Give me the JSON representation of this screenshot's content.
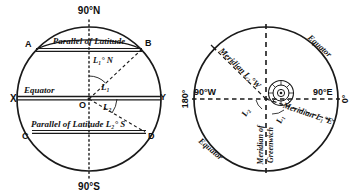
{
  "figure": {
    "background_color": "#ffffff",
    "line_color": "#1a1a1a"
  },
  "left_diagram": {
    "name": "parallels-of-latitude-sphere",
    "poles": {
      "north": "90°N",
      "south": "90°S"
    },
    "axis_points": {
      "left": "X",
      "right": "Y",
      "center": "O"
    },
    "corner_points": {
      "upper_left": "A",
      "upper_right": "B",
      "lower_left": "C",
      "lower_right": "D"
    },
    "lines": [
      {
        "label": "Equator",
        "kind": "equator"
      },
      {
        "label": "Parallel of Latitude",
        "sub": "L",
        "subscript": "1",
        "degree": "°",
        "hemisphere": "N",
        "kind": "parallel-north"
      },
      {
        "label": "Parallel of Latitude",
        "sub": "L",
        "subscript": "2",
        "degree": "°",
        "hemisphere": "S",
        "kind": "parallel-south"
      }
    ],
    "angles": [
      {
        "label": "L",
        "subscript": "1",
        "meaning": "latitude-angle-north"
      },
      {
        "label": "L",
        "subscript": "2",
        "meaning": "latitude-angle-south"
      }
    ],
    "text": {
      "equator": "Equator",
      "parallel_of_latitude": "Parallel of Latitude",
      "lat1_tag": "L₁° N",
      "lat2_full": "Parallel of Latitude L₂° S"
    }
  },
  "right_diagram": {
    "name": "meridians-of-longitude-globe-polar-view",
    "cardinal_labels": {
      "top": "180°",
      "bottom": "0°",
      "left": "90°W",
      "right": "90°E"
    },
    "meridians": [
      {
        "label": "Meridian of Greenwich",
        "value": "0°",
        "kind": "prime-meridian"
      },
      {
        "label": "Meridian L₂° W",
        "kind": "meridian-west"
      },
      {
        "label": "Meridian L₁° E",
        "kind": "meridian-east"
      }
    ],
    "angles": [
      {
        "label": "L",
        "subscript": "2",
        "meaning": "longitude-angle-west"
      },
      {
        "label": "L",
        "subscript": "1",
        "meaning": "longitude-angle-east"
      }
    ],
    "edge_labels": {
      "equator_upper_right": "Equator",
      "equator_lower_left": "Equator"
    },
    "text": {
      "meridian_west": "Meridian L₂°W",
      "meridian_east": "Meridian L₁°E",
      "greenwich_line1": "Meridian of",
      "greenwich_line2": "Greenwich"
    }
  }
}
